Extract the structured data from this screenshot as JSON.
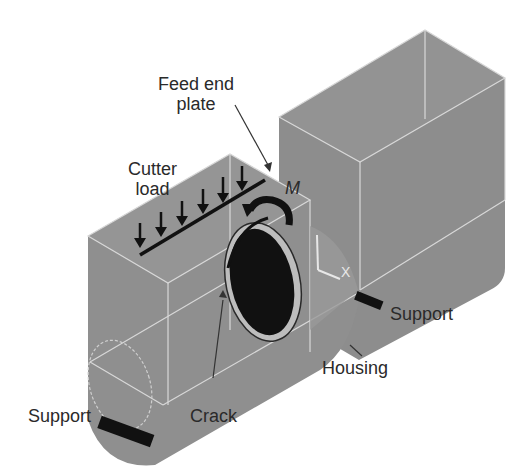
{
  "diagram": {
    "type": "isometric mechanical model",
    "colors": {
      "body": "#8f8f8f",
      "body_dark": "#7d7d7d",
      "edge": "#d8d8d8",
      "hole": "#111111",
      "label": "#2a2a2a",
      "support": "#111111"
    },
    "labels": {
      "feed_end_plate_line1": "Feed end",
      "feed_end_plate_line2": "plate",
      "cutter_load_line1": "Cutter",
      "cutter_load_line2": "load",
      "moment": "M",
      "axis_x": "X",
      "axis_y": "Y",
      "support_right": "Support",
      "support_left": "Support",
      "housing": "Housing",
      "crack": "Crack"
    },
    "load_arrows_count": 7
  }
}
